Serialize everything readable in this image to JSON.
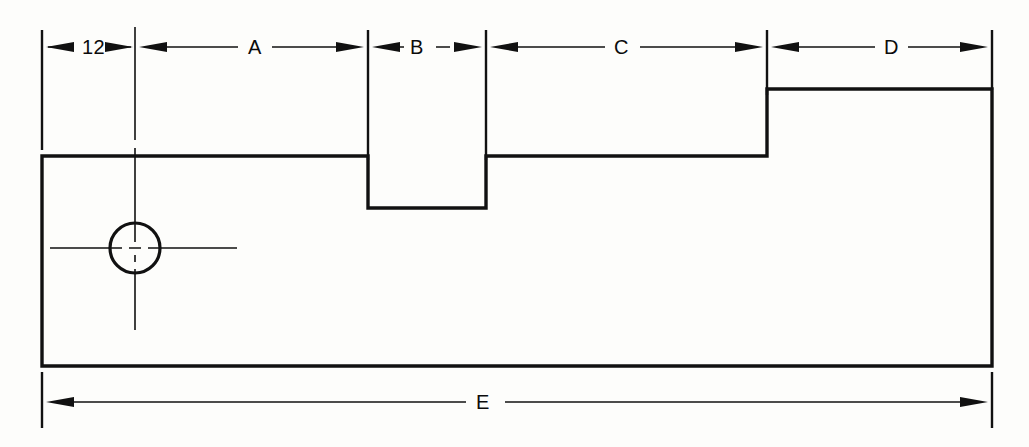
{
  "drawing": {
    "title": "Part profile with dimension callouts",
    "background_color": "#fdfdfb",
    "line_color": "#111111",
    "dimensions": [
      {
        "id": "dim-12",
        "label": "12",
        "from_x": 42,
        "to_x": 135,
        "y": 47,
        "placement": "top",
        "style": "outside-arrows"
      },
      {
        "id": "dim-a",
        "label": "A",
        "from_x": 135,
        "to_x": 368,
        "y": 47,
        "placement": "top",
        "style": "inside-arrows"
      },
      {
        "id": "dim-b",
        "label": "B",
        "from_x": 368,
        "to_x": 486,
        "y": 47,
        "placement": "top",
        "style": "inside-arrows"
      },
      {
        "id": "dim-c",
        "label": "C",
        "from_x": 486,
        "to_x": 767,
        "y": 47,
        "placement": "top",
        "style": "inside-arrows"
      },
      {
        "id": "dim-d",
        "label": "D",
        "from_x": 767,
        "to_x": 992,
        "y": 47,
        "placement": "top",
        "style": "inside-arrows"
      },
      {
        "id": "dim-e",
        "label": "E",
        "from_x": 42,
        "to_x": 992,
        "y": 402,
        "placement": "bottom",
        "style": "inside-arrows"
      }
    ],
    "extension_lines": [
      {
        "id": "ext-left-top",
        "x": 42,
        "y1": 30,
        "y2": 150
      },
      {
        "id": "ext-center-hole",
        "x": 135,
        "y1": 27,
        "y2": 330
      },
      {
        "id": "ext-notch-left",
        "x": 368,
        "y1": 30,
        "y2": 160
      },
      {
        "id": "ext-notch-right",
        "x": 486,
        "y1": 30,
        "y2": 160
      },
      {
        "id": "ext-step",
        "x": 767,
        "y1": 30,
        "y2": 95
      },
      {
        "id": "ext-right-top",
        "x": 992,
        "y1": 30,
        "y2": 90
      },
      {
        "id": "ext-left-bottom",
        "x": 42,
        "y1": 372,
        "y2": 428
      },
      {
        "id": "ext-right-bottom",
        "x": 992,
        "y1": 372,
        "y2": 428
      }
    ],
    "profile": {
      "id": "part-outline",
      "points": "42,156 368,156 368,208 486,208 486,156 767,156 767,89 992,89 992,366 42,366 42,156",
      "description": "rectangular block with top notch and right-hand step"
    },
    "hole": {
      "id": "through-hole",
      "center_x": 135,
      "center_y": 248,
      "radius": 25,
      "centerline_h": {
        "x1": 50,
        "x2": 237,
        "y": 248
      },
      "centerline_v": {
        "y1": 27,
        "y2": 330,
        "x": 135
      }
    }
  }
}
